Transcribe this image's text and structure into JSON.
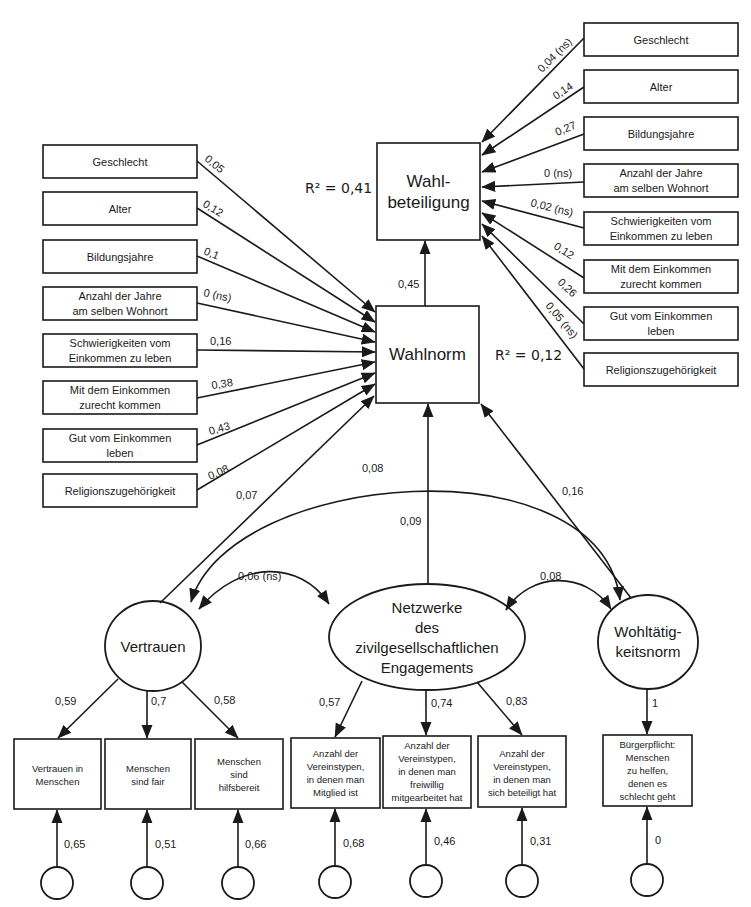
{
  "diagram": {
    "type": "structural-equation-path-diagram",
    "outcome": {
      "label_line1": "Wahl-",
      "label_line2": "beteiligung",
      "r_squared": "R² = 0,41"
    },
    "mediator": {
      "label": "Wahlnorm",
      "r_squared": "R² = 0,12",
      "path_to_outcome": "0,45"
    },
    "left_predictors": [
      {
        "line1": "Geschlecht",
        "line2": "",
        "coef": "0,05"
      },
      {
        "line1": "Alter",
        "line2": "",
        "coef": "0,12"
      },
      {
        "line1": "Bildungsjahre",
        "line2": "",
        "coef": "0,1"
      },
      {
        "line1": "Anzahl der Jahre",
        "line2": "am selben Wohnort",
        "coef": "0 (ns)"
      },
      {
        "line1": "Schwierigkeiten vom",
        "line2": "Einkommen zu leben",
        "coef": "0,16"
      },
      {
        "line1": "Mit dem Einkommen",
        "line2": "zurecht kommen",
        "coef": "0,38"
      },
      {
        "line1": "Gut vom Einkommen",
        "line2": "leben",
        "coef": "0,43"
      },
      {
        "line1": "Religionszugehörigkeit",
        "line2": "",
        "coef": "0,08"
      }
    ],
    "right_predictors": [
      {
        "line1": "Geschlecht",
        "line2": "",
        "coef": "0,04 (ns)"
      },
      {
        "line1": "Alter",
        "line2": "",
        "coef": "0,14"
      },
      {
        "line1": "Bildungsjahre",
        "line2": "",
        "coef": "0,27"
      },
      {
        "line1": "Anzahl der Jahre",
        "line2": "am selben Wohnort",
        "coef": "0 (ns)"
      },
      {
        "line1": "Schwierigkeiten vom",
        "line2": "Einkommen zu leben",
        "coef": "0,02 (ns)"
      },
      {
        "line1": "Mit dem Einkommen",
        "line2": "zurecht kommen",
        "coef": "0,12"
      },
      {
        "line1": "Gut vom Einkommen",
        "line2": "leben",
        "coef": "0,26"
      },
      {
        "line1": "Religionszugehörigkeit",
        "line2": "",
        "coef": "0,05 (ns)"
      }
    ],
    "latents": {
      "vertrauen": {
        "label": "Vertrauen",
        "path_to_wahlnorm": "0,07"
      },
      "netzwerke": {
        "line1": "Netzwerke",
        "line2": "des",
        "line3": "zivilgesellschaftlichen",
        "line4": "Engagements",
        "path_to_wahlnorm": "0,09"
      },
      "wohltaetigkeit": {
        "line1": "Wohltätig-",
        "line2": "keitsnorm",
        "path_to_wahlnorm": "0,16"
      }
    },
    "correlations": {
      "vertrauen_netzwerke": "0,06 (ns)",
      "netzwerke_wohltaetigkeit": "0,08",
      "vertrauen_wohltaetigkeit": "0,08"
    },
    "indicators": [
      {
        "lines": [
          "Vertrauen in",
          "Menschen"
        ],
        "loading": "0,59",
        "error": "0,65"
      },
      {
        "lines": [
          "Menschen",
          "sind fair"
        ],
        "loading": "0,7",
        "error": "0,51"
      },
      {
        "lines": [
          "Menschen",
          "sind",
          "hilfsbereit"
        ],
        "loading": "0,58",
        "error": "0,66"
      },
      {
        "lines": [
          "Anzahl der",
          "Vereinstypen,",
          "in denen man",
          "Mitglied ist"
        ],
        "loading": "0,57",
        "error": "0,68"
      },
      {
        "lines": [
          "Anzahl der",
          "Vereinstypen,",
          "in denen man",
          "freiwillig",
          "mitgearbeitet hat"
        ],
        "loading": "0,74",
        "error": "0,46"
      },
      {
        "lines": [
          "Anzahl der",
          "Vereinstypen,",
          "in denen man",
          "sich beteiligt hat"
        ],
        "loading": "0,83",
        "error": "0,31"
      },
      {
        "lines": [
          "Bürgerpflicht:",
          "Menschen",
          "zu helfen,",
          "denen es",
          "schlecht geht"
        ],
        "loading": "1",
        "error": "0"
      }
    ]
  }
}
